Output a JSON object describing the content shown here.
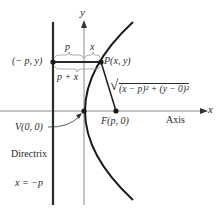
{
  "diagram": {
    "colors": {
      "curve": "#1a1a1a",
      "axis": "#7a7a7a",
      "directrix": "#2a2a2a",
      "text": "#2a2a2a"
    },
    "axes": {
      "x_label": "x",
      "y_label": "y",
      "axis_label": "Axis"
    },
    "labels": {
      "directrix_point": "(− p, y)",
      "point_p": "P(x, y)",
      "segment_p": "p",
      "segment_x": "x",
      "segment_p_plus_x": "p + x",
      "distance_formula_radical": "√",
      "distance_formula": "(x − p)² + (y − 0)²",
      "vertex": "V(0, 0)",
      "focus": "F(p, 0)",
      "directrix": "Directrix",
      "directrix_equation": "x = −p"
    },
    "points": [
      {
        "name": "directrix-point",
        "label": "(− p, y)"
      },
      {
        "name": "point-p",
        "label": "P(x, y)"
      },
      {
        "name": "vertex",
        "label": "V(0, 0)"
      },
      {
        "name": "focus",
        "label": "F(p, 0)"
      }
    ]
  }
}
